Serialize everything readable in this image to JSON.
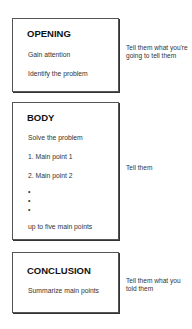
{
  "sections": [
    {
      "title": "OPENING",
      "lines": [
        "Gain attention",
        "Identify the problem"
      ],
      "note": "Tell them what you're going to tell them"
    },
    {
      "title": "BODY",
      "lines": [
        "Solve the problem",
        "1.  Main point 1",
        "2.  Main point 2",
        "up to five main points"
      ],
      "bullets": [
        "•",
        "•",
        "•"
      ],
      "note": "Tell them"
    },
    {
      "title": "CONCLUSION",
      "lines": [
        "Summarize main points"
      ],
      "note": "Tell them what you told them"
    }
  ]
}
